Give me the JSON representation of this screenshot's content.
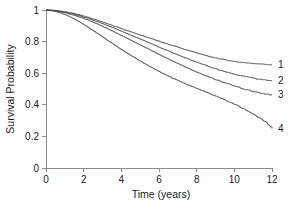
{
  "chart_data": {
    "type": "line",
    "title": "",
    "subtitle": "",
    "xlabel": "Time (years)",
    "ylabel": "Survival Probability",
    "xlim": [
      0,
      12
    ],
    "ylim": [
      0,
      1
    ],
    "xticks": [
      "0",
      "2",
      "4",
      "6",
      "8",
      "10",
      "12"
    ],
    "xtick_values": [
      0,
      2,
      4,
      6,
      8,
      10,
      12
    ],
    "yticks": [
      "0",
      "0.2",
      "0.4",
      "0.6",
      "0.8",
      "1"
    ],
    "ytick_values": [
      0,
      0.2,
      0.4,
      0.6,
      0.8,
      1
    ],
    "grid": false,
    "legend_position": "right-endpoint-labels",
    "annotations": [
      "1",
      "2",
      "3",
      "4"
    ],
    "line_color": "#4a4a4a",
    "axis_color": "#8a8a8a",
    "background_color": "#ffffff",
    "series": [
      {
        "name": "1",
        "label": "1",
        "end_label": "1",
        "x": [
          0,
          0.3,
          0.6,
          0.9,
          1.2,
          1.5,
          1.8,
          2.1,
          2.4,
          2.7,
          3.0,
          3.3,
          3.6,
          3.9,
          4.2,
          4.5,
          4.8,
          5.1,
          5.4,
          5.7,
          6.0,
          6.3,
          6.6,
          6.9,
          7.2,
          7.5,
          7.8,
          8.1,
          8.4,
          8.7,
          9.0,
          9.3,
          9.6,
          9.9,
          10.2,
          10.5,
          10.8,
          11.1,
          11.4,
          11.7,
          12.0
        ],
        "y": [
          1.0,
          0.999,
          0.996,
          0.991,
          0.985,
          0.977,
          0.968,
          0.958,
          0.947,
          0.935,
          0.923,
          0.911,
          0.898,
          0.886,
          0.873,
          0.861,
          0.849,
          0.837,
          0.825,
          0.814,
          0.802,
          0.79,
          0.779,
          0.768,
          0.757,
          0.746,
          0.735,
          0.724,
          0.714,
          0.705,
          0.697,
          0.69,
          0.683,
          0.677,
          0.672,
          0.668,
          0.665,
          0.662,
          0.66,
          0.657,
          0.655
        ]
      },
      {
        "name": "2",
        "label": "2",
        "end_label": "2",
        "x": [
          0,
          0.3,
          0.6,
          0.9,
          1.2,
          1.5,
          1.8,
          2.1,
          2.4,
          2.7,
          3.0,
          3.3,
          3.6,
          3.9,
          4.2,
          4.5,
          4.8,
          5.1,
          5.4,
          5.7,
          6.0,
          6.3,
          6.6,
          6.9,
          7.2,
          7.5,
          7.8,
          8.1,
          8.4,
          8.7,
          9.0,
          9.3,
          9.6,
          9.9,
          10.2,
          10.5,
          10.8,
          11.1,
          11.4,
          11.7,
          12.0
        ],
        "y": [
          1.0,
          0.998,
          0.994,
          0.988,
          0.981,
          0.972,
          0.962,
          0.951,
          0.939,
          0.926,
          0.913,
          0.899,
          0.885,
          0.87,
          0.855,
          0.84,
          0.825,
          0.81,
          0.795,
          0.78,
          0.765,
          0.75,
          0.735,
          0.72,
          0.706,
          0.692,
          0.678,
          0.665,
          0.652,
          0.64,
          0.628,
          0.617,
          0.607,
          0.597,
          0.588,
          0.58,
          0.573,
          0.567,
          0.562,
          0.558,
          0.556
        ]
      },
      {
        "name": "3",
        "label": "3",
        "end_label": "3",
        "x": [
          0,
          0.3,
          0.6,
          0.9,
          1.2,
          1.5,
          1.8,
          2.1,
          2.4,
          2.7,
          3.0,
          3.3,
          3.6,
          3.9,
          4.2,
          4.5,
          4.8,
          5.1,
          5.4,
          5.7,
          6.0,
          6.3,
          6.6,
          6.9,
          7.2,
          7.5,
          7.8,
          8.1,
          8.4,
          8.7,
          9.0,
          9.3,
          9.6,
          9.9,
          10.2,
          10.5,
          10.8,
          11.1,
          11.4,
          11.7,
          12.0
        ],
        "y": [
          1.0,
          0.997,
          0.992,
          0.985,
          0.976,
          0.966,
          0.954,
          0.941,
          0.927,
          0.912,
          0.896,
          0.879,
          0.862,
          0.844,
          0.826,
          0.808,
          0.79,
          0.772,
          0.754,
          0.736,
          0.718,
          0.7,
          0.683,
          0.666,
          0.649,
          0.633,
          0.617,
          0.602,
          0.587,
          0.573,
          0.56,
          0.547,
          0.535,
          0.523,
          0.512,
          0.501,
          0.491,
          0.482,
          0.474,
          0.468,
          0.465
        ]
      },
      {
        "name": "4",
        "label": "4",
        "end_label": "4",
        "x": [
          0,
          0.3,
          0.6,
          0.9,
          1.2,
          1.5,
          1.8,
          2.1,
          2.4,
          2.7,
          3.0,
          3.3,
          3.6,
          3.9,
          4.2,
          4.5,
          4.8,
          5.1,
          5.4,
          5.7,
          6.0,
          6.3,
          6.6,
          6.9,
          7.2,
          7.5,
          7.8,
          8.1,
          8.4,
          8.7,
          9.0,
          9.3,
          9.6,
          9.9,
          10.2,
          10.5,
          10.8,
          11.1,
          11.4,
          11.7,
          12.0
        ],
        "y": [
          1.0,
          0.995,
          0.987,
          0.975,
          0.96,
          0.942,
          0.922,
          0.9,
          0.877,
          0.853,
          0.829,
          0.805,
          0.781,
          0.757,
          0.734,
          0.712,
          0.69,
          0.669,
          0.649,
          0.629,
          0.61,
          0.592,
          0.575,
          0.558,
          0.542,
          0.527,
          0.512,
          0.498,
          0.484,
          0.47,
          0.456,
          0.441,
          0.425,
          0.409,
          0.392,
          0.374,
          0.355,
          0.335,
          0.312,
          0.285,
          0.253
        ]
      }
    ]
  }
}
